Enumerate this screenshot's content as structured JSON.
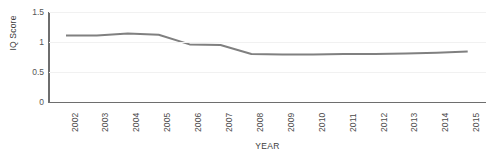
{
  "chart_data": {
    "type": "line",
    "title": "",
    "xlabel": "YEAR",
    "ylabel": "IQ Score",
    "categories": [
      "2002",
      "2003",
      "2004",
      "2005",
      "2006",
      "2007",
      "2008",
      "2009",
      "2010",
      "2011",
      "2012",
      "2013",
      "2014",
      "2015"
    ],
    "values": [
      1.11,
      1.11,
      1.14,
      1.12,
      0.96,
      0.95,
      0.8,
      0.79,
      0.79,
      0.8,
      0.8,
      0.81,
      0.82,
      0.84
    ],
    "series": [
      {
        "name": "IQ Score",
        "values": [
          1.11,
          1.11,
          1.14,
          1.12,
          0.96,
          0.95,
          0.8,
          0.79,
          0.79,
          0.8,
          0.8,
          0.81,
          0.82,
          0.84
        ]
      }
    ],
    "ylim": [
      0,
      1.5
    ],
    "y_ticks": [
      "0",
      "0.5",
      "1",
      "1.5"
    ],
    "y_tick_values": [
      0,
      0.5,
      1,
      1.5
    ],
    "grid": true,
    "grid_axis": "y",
    "legend": false,
    "legend_position": "none",
    "line_color": "#808080",
    "axis_color": "#6e6e6e",
    "gridline_color": "#f1f1f1",
    "annotations": []
  }
}
